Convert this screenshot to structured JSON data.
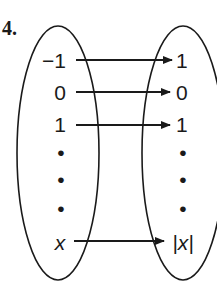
{
  "problem_number": "4.",
  "domain_set": {
    "items": [
      "−1",
      "0",
      "1",
      "•",
      "•",
      "•",
      "x"
    ]
  },
  "range_set": {
    "items": [
      "1",
      "0",
      "1",
      "•",
      "•",
      "•",
      "|x|"
    ]
  },
  "mappings": [
    {
      "from": "−1",
      "to": "1"
    },
    {
      "from": "0",
      "to": "0"
    },
    {
      "from": "1",
      "to": "1"
    },
    {
      "from": "x",
      "to": "|x|"
    }
  ],
  "colors": {
    "stroke": "#1a1a1a",
    "background": "#ffffff"
  }
}
